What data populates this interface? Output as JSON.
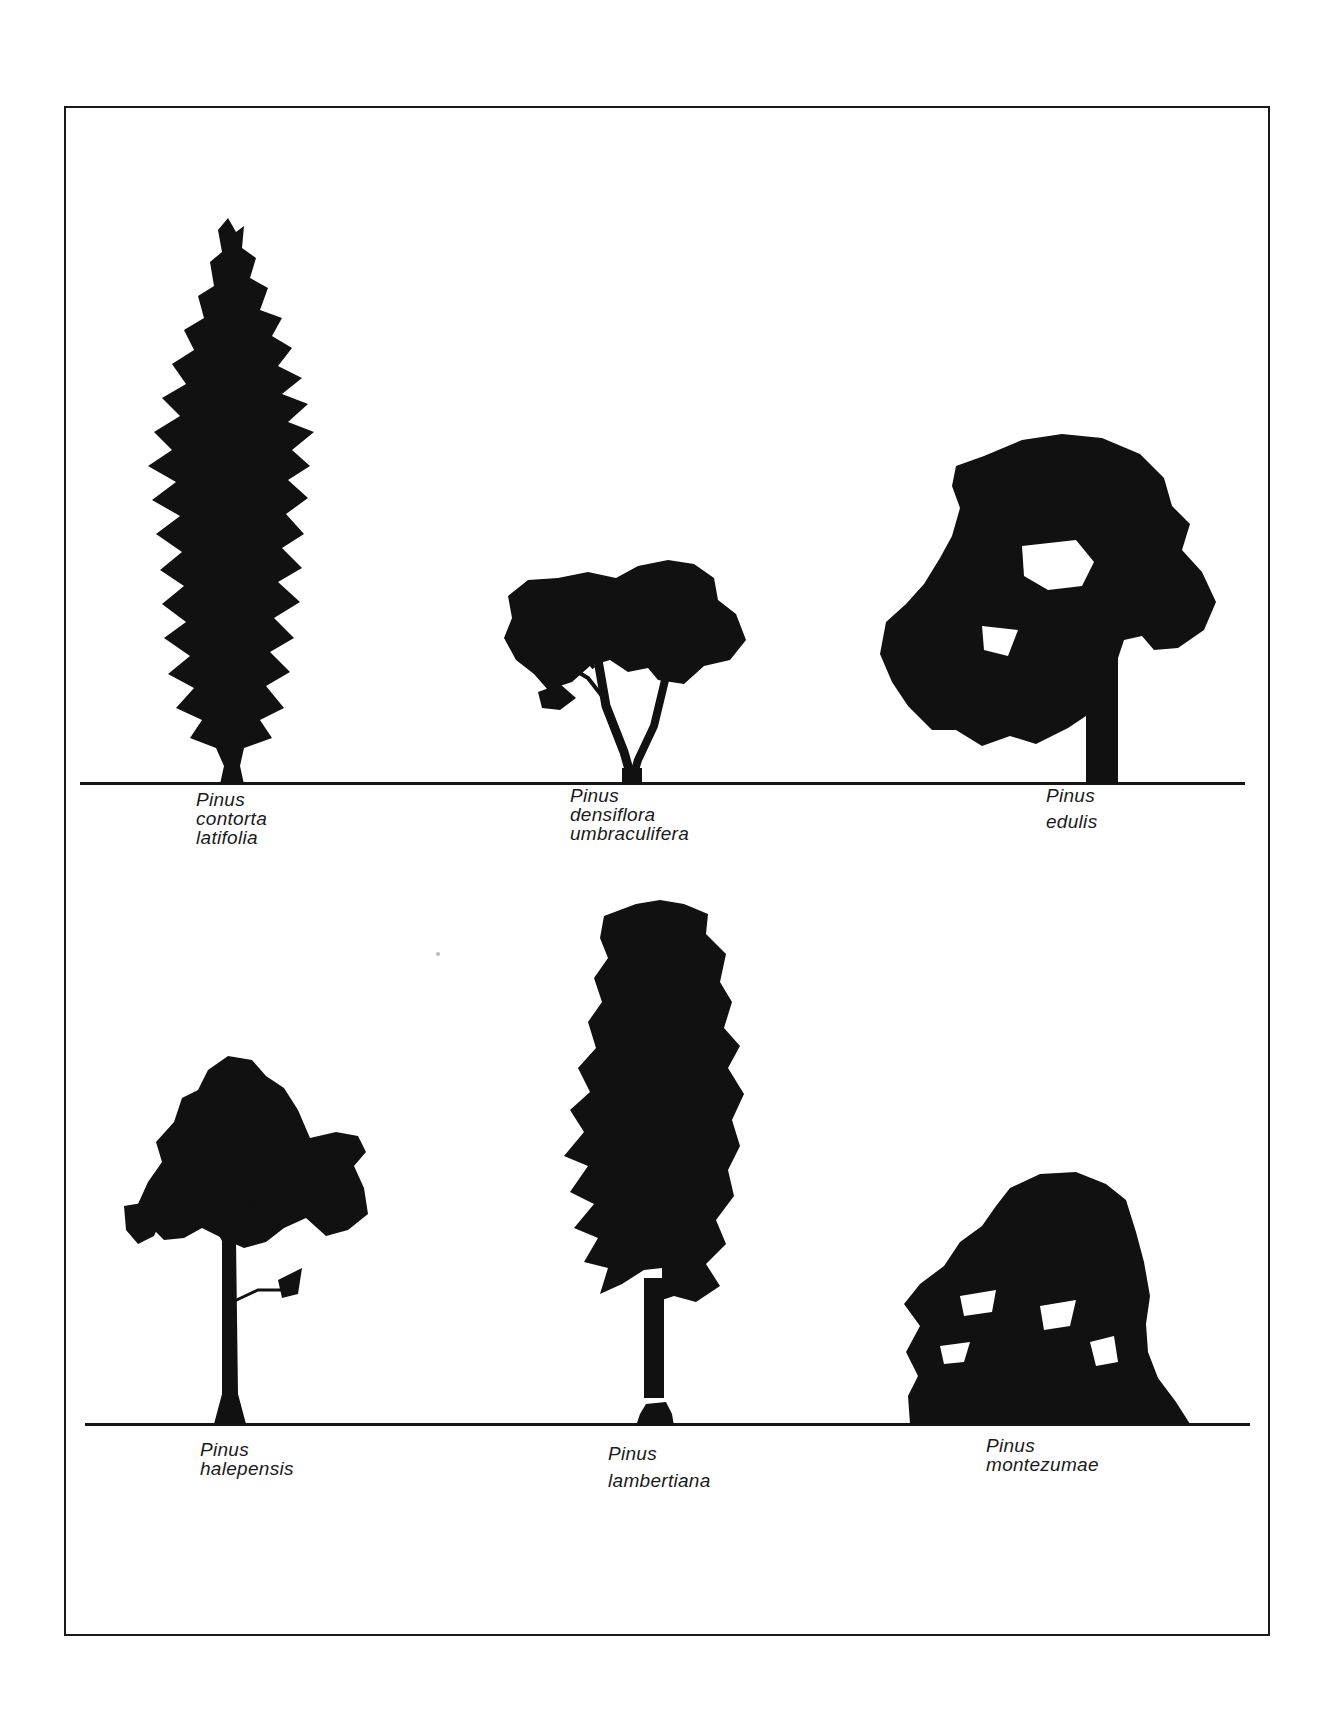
{
  "figure": {
    "ink_color": "#111111",
    "paper_color": "#ffffff",
    "rows": [
      {
        "trees": [
          {
            "genus": "Pinus",
            "epithet": "contorta",
            "variety": "latifolia",
            "form": "narrow-columnar conifer"
          },
          {
            "genus": "Pinus",
            "epithet": "densiflora",
            "variety": "umbraculifera",
            "form": "umbrella-shaped spreading crown"
          },
          {
            "genus": "Pinus",
            "epithet": "edulis",
            "variety": "",
            "form": "broad irregular rounded crown"
          }
        ]
      },
      {
        "trees": [
          {
            "genus": "Pinus",
            "epithet": "halepensis",
            "variety": "",
            "form": "open irregular crown on tall trunk"
          },
          {
            "genus": "Pinus",
            "epithet": "lambertiana",
            "variety": "",
            "form": "tall columnar crown, long bare trunk"
          },
          {
            "genus": "Pinus",
            "epithet": "montezumae",
            "variety": "",
            "form": "dense domed low crown"
          }
        ]
      }
    ]
  }
}
